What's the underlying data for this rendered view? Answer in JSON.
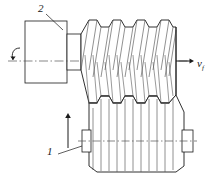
{
  "figure": {
    "kind": "engineering-diagram",
    "background_color": "#ffffff",
    "line_color": "#1a1a1a",
    "shade_color": "#7a7a7a"
  },
  "labels": {
    "workpiece_number": "1",
    "tool_number": "2",
    "feed_velocity_symbol": "v",
    "feed_velocity_subscript": "f"
  },
  "annotations": {
    "rotation_arrow_name": "spindle-rotation-arrow",
    "feed_axis_arrow_name": "horizontal-feed-arrow",
    "vertical_feed_arrow_name": "vertical-feed-arrow",
    "leader_to_tool": "leader line from numeral 2 to hob body",
    "leader_to_workpiece": "leader line from numeral 1 to gear blank"
  },
  "parts": {
    "spindle_block_name": "tool-holder-block",
    "hob_name": "hob-cutter",
    "gear_blank_name": "gear-blank-workpiece",
    "hob_teeth_count": 5,
    "gear_teeth_count": 5
  }
}
